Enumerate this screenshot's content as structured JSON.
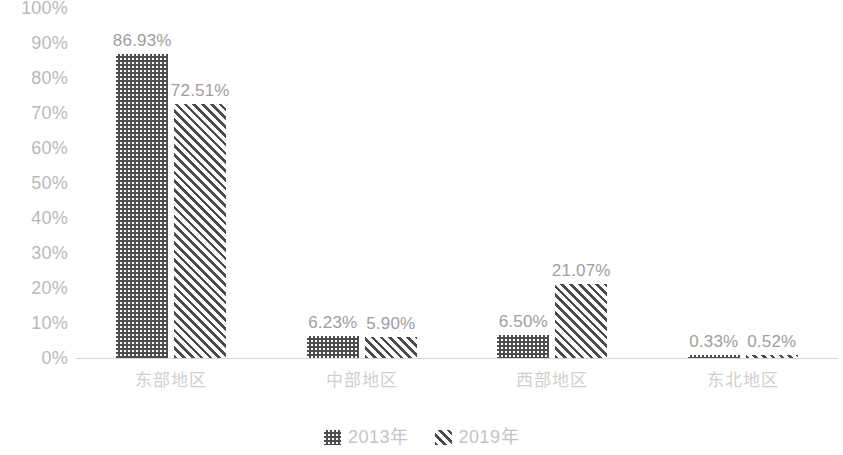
{
  "chart_data": {
    "type": "bar",
    "title": "",
    "subtitle": "",
    "xlabel": "",
    "ylabel": "",
    "ylim": [
      0,
      100
    ],
    "grid": false,
    "legend_position": "bottom",
    "categories": [
      "东部地区",
      "中部地区",
      "西部地区",
      "东北地区"
    ],
    "y_ticks": [
      "100%",
      "90%",
      "80%",
      "70%",
      "60%",
      "50%",
      "40%",
      "30%",
      "20%",
      "10%",
      "0%"
    ],
    "y_tick_values": [
      100,
      90,
      80,
      70,
      60,
      50,
      40,
      30,
      20,
      10,
      0
    ],
    "series": [
      {
        "name": "2013年",
        "pattern": "dotted",
        "color": "#4d4d4d",
        "values": [
          86.93,
          6.23,
          6.5,
          0.33
        ],
        "labels": [
          "86.93%",
          "6.23%",
          "6.50%",
          "0.33%"
        ]
      },
      {
        "name": "2019年",
        "pattern": "diagonal-stripes",
        "color": "#4a4a4a",
        "values": [
          72.51,
          5.9,
          21.07,
          0.52
        ],
        "labels": [
          "72.51%",
          "5.90%",
          "21.07%",
          "0.52%"
        ]
      }
    ]
  },
  "legend": {
    "items": [
      {
        "label": "2013年",
        "pattern": "dotted"
      },
      {
        "label": "2019年",
        "pattern": "diagonal-stripes"
      }
    ]
  }
}
